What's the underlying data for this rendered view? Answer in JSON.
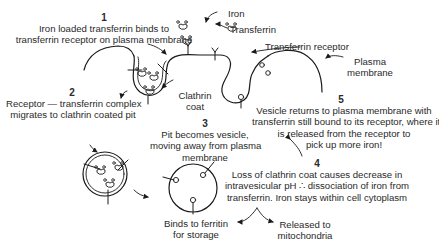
{
  "diagram": {
    "labels": {
      "iron": "Iron",
      "transferrin": "Transferrin",
      "transferrin_receptor": "Transferrin receptor",
      "plasma_membrane_line1": "Plasma",
      "plasma_membrane_line2": "membrane",
      "clathrin_coat_line1": "Clathrin",
      "clathrin_coat_line2": "coat"
    },
    "steps": [
      {
        "number": "1",
        "lines": [
          "Iron loaded transferrin binds to",
          "transferrin receptor on plasma membrane"
        ]
      },
      {
        "number": "2",
        "lines": [
          "Receptor — transferrin complex",
          "migrates to clathrin coated pit"
        ]
      },
      {
        "number": "3",
        "lines": [
          "Pit becomes vesicle,",
          "moving away from plasma",
          "membrane"
        ]
      },
      {
        "number": "4",
        "lines": [
          "Loss of clathrin coat causes decrease in",
          "intravesicular pH ∴ dissociation of iron from",
          "transferrin. Iron stays within cell cytoplasm"
        ]
      },
      {
        "number": "5",
        "lines": [
          "Vesicle returns to plasma membrane with",
          "transferrin still bound to its receptor, where it",
          "is released from the receptor to",
          "pick up more iron!"
        ]
      }
    ],
    "fates": {
      "storage_line1": "Binds to ferritin",
      "storage_line2": "for storage",
      "mito_line1": "Released to",
      "mito_line2": "mitochondria"
    }
  }
}
